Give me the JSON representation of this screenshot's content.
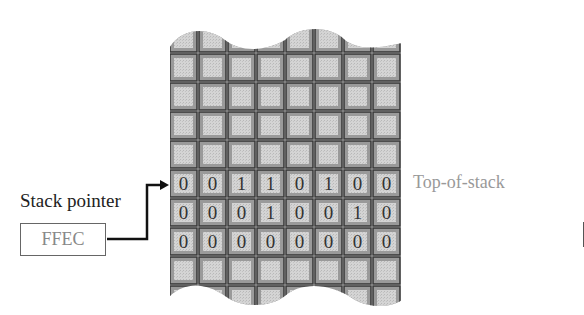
{
  "diagram": {
    "stack_pointer": {
      "label": "Stack pointer",
      "value": "FFEC"
    },
    "top_of_stack_label": "Top-of-stack",
    "memory": {
      "columns": 8,
      "rows_total": 10,
      "rows_with_data": [
        {
          "row_index": 5,
          "bits": [
            "0",
            "0",
            "1",
            "1",
            "0",
            "1",
            "0",
            "0"
          ],
          "is_top_of_stack": true
        },
        {
          "row_index": 6,
          "bits": [
            "0",
            "0",
            "0",
            "1",
            "0",
            "0",
            "1",
            "0"
          ],
          "is_top_of_stack": false
        },
        {
          "row_index": 7,
          "bits": [
            "0",
            "0",
            "0",
            "0",
            "0",
            "0",
            "0",
            "0"
          ],
          "is_top_of_stack": false
        }
      ],
      "top_edge": "wavy-break",
      "bottom_edge": "wavy-break"
    },
    "colors": {
      "cell_fill": "#c8c8c8",
      "cell_inner": "#d9d9d9",
      "cell_border": "#3a3a3a",
      "arrow": "#111111",
      "label_gray": "#999999"
    }
  }
}
